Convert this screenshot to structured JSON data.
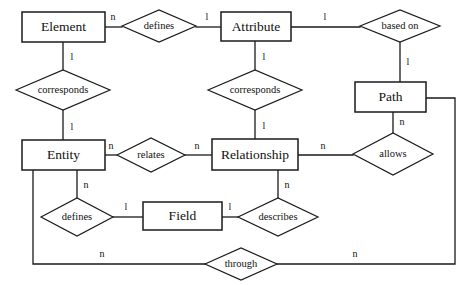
{
  "diagram": {
    "type": "entity-relationship-diagram",
    "width": 464,
    "height": 285,
    "background_color": "#ffffff",
    "line_color": "#1a1a1a",
    "text_color": "#111111",
    "entities": [
      {
        "id": "element",
        "label": "Element",
        "x": 22,
        "y": 12,
        "w": 83,
        "h": 30
      },
      {
        "id": "attribute",
        "label": "Attribute",
        "x": 221,
        "y": 12,
        "w": 70,
        "h": 29
      },
      {
        "id": "path",
        "label": "Path",
        "x": 355,
        "y": 82,
        "w": 71,
        "h": 30
      },
      {
        "id": "entity",
        "label": "Entity",
        "x": 22,
        "y": 140,
        "w": 83,
        "h": 30
      },
      {
        "id": "relationship",
        "label": "Relationship",
        "x": 212,
        "y": 139,
        "w": 86,
        "h": 31
      },
      {
        "id": "field",
        "label": "Field",
        "x": 143,
        "y": 202,
        "w": 79,
        "h": 28
      }
    ],
    "relationships": [
      {
        "id": "defines-top",
        "label": "defines",
        "cx": 159,
        "cy": 26,
        "rx": 37,
        "ry": 16
      },
      {
        "id": "based-on",
        "label": "based on",
        "cx": 400,
        "cy": 26,
        "rx": 40,
        "ry": 16
      },
      {
        "id": "corresponds-left",
        "label": "corresponds",
        "cx": 63,
        "cy": 90,
        "rx": 47,
        "ry": 20
      },
      {
        "id": "corresponds-right",
        "label": "corresponds",
        "cx": 255,
        "cy": 90,
        "rx": 47,
        "ry": 20
      },
      {
        "id": "relates",
        "label": "relates",
        "cx": 151,
        "cy": 155,
        "rx": 34,
        "ry": 17
      },
      {
        "id": "allows",
        "label": "allows",
        "cx": 393,
        "cy": 154,
        "rx": 40,
        "ry": 21
      },
      {
        "id": "defines-bottom",
        "label": "defines",
        "cx": 77,
        "cy": 217,
        "rx": 36,
        "ry": 19
      },
      {
        "id": "describes",
        "label": "describes",
        "cx": 278,
        "cy": 217,
        "rx": 40,
        "ry": 19
      },
      {
        "id": "through",
        "label": "through",
        "cx": 241,
        "cy": 264,
        "rx": 36,
        "ry": 16
      }
    ],
    "connections": [
      {
        "id": "element-defines",
        "from": "element",
        "to": "defines-top",
        "points": "105,27 122,27",
        "cardinality": "n",
        "cx": 113,
        "cy": 17
      },
      {
        "id": "defines-attribute",
        "from": "defines-top",
        "to": "attribute",
        "points": "196,27 221,27",
        "cardinality": "l",
        "cx": 207,
        "cy": 17
      },
      {
        "id": "attribute-basedon",
        "from": "attribute",
        "to": "based-on",
        "points": "291,27 360,27",
        "cardinality": "l",
        "cx": 325,
        "cy": 17
      },
      {
        "id": "element-corresponds",
        "from": "element",
        "to": "corresponds-left",
        "points": "63,42 63,70",
        "cardinality": "l",
        "cx": 72,
        "cy": 57
      },
      {
        "id": "corresponds-entity",
        "from": "corresponds-left",
        "to": "entity",
        "points": "63,110 63,140",
        "cardinality": "l",
        "cx": 72,
        "cy": 127
      },
      {
        "id": "attribute-corresponds",
        "from": "attribute",
        "to": "corresponds-right",
        "points": "255,41 255,70",
        "cardinality": "l",
        "cx": 264,
        "cy": 57
      },
      {
        "id": "corresponds-relationship",
        "from": "corresponds-right",
        "to": "relationship",
        "points": "255,110 255,139",
        "cardinality": "l",
        "cx": 264,
        "cy": 126
      },
      {
        "id": "basedon-path",
        "from": "based-on",
        "to": "path",
        "points": "400,42 400,82",
        "cardinality": "l",
        "cx": 408,
        "cy": 62
      },
      {
        "id": "path-allows",
        "from": "path",
        "to": "allows",
        "points": "393,112 393,133",
        "cardinality": "n",
        "cx": 402,
        "cy": 122
      },
      {
        "id": "entity-relates",
        "from": "entity",
        "to": "relates",
        "points": "105,155 117,155",
        "cardinality": "n",
        "cx": 111,
        "cy": 146
      },
      {
        "id": "relates-relationship",
        "from": "relates",
        "to": "relationship",
        "points": "185,155 212,155",
        "cardinality": "n",
        "cx": 197,
        "cy": 146
      },
      {
        "id": "relationship-allows",
        "from": "relationship",
        "to": "allows",
        "points": "298,155 353,155",
        "cardinality": "n",
        "cx": 323,
        "cy": 146
      },
      {
        "id": "entity-defines",
        "from": "entity",
        "to": "defines-bottom",
        "points": "77,170 77,198",
        "cardinality": "n",
        "cx": 86,
        "cy": 185
      },
      {
        "id": "defines-field",
        "from": "defines-bottom",
        "to": "field",
        "points": "113,217 143,217",
        "cardinality": "l",
        "cx": 126,
        "cy": 207
      },
      {
        "id": "field-describes",
        "from": "field",
        "to": "describes",
        "points": "222,217 238,217",
        "cardinality": "l",
        "cx": 230,
        "cy": 207
      },
      {
        "id": "relationship-describes",
        "from": "relationship",
        "to": "describes",
        "points": "278,170 278,198",
        "cardinality": "n",
        "cx": 287,
        "cy": 185
      },
      {
        "id": "entity-through",
        "from": "entity",
        "to": "through",
        "points": "33,170 33,264 206,264",
        "cardinality": "n",
        "cx": 102,
        "cy": 254
      },
      {
        "id": "through-path",
        "from": "through",
        "to": "path",
        "points": "277,264 455,264 455,98 426,98",
        "cardinality": "n",
        "cx": 355,
        "cy": 254
      }
    ]
  }
}
